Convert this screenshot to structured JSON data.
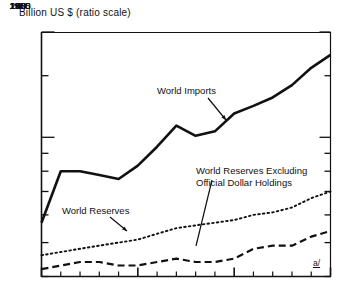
{
  "chart_data": {
    "type": "line",
    "title": "Billion US $ (ratio scale)",
    "xlabel": "",
    "ylabel": "Billion US $",
    "scale": "log",
    "grid": false,
    "legend_position": "inline-annotations",
    "axis": {
      "x_range": [
        1950,
        1965
      ],
      "y_range": [
        40,
        200
      ],
      "y_ticks": [
        200,
        150,
        100,
        90,
        80,
        70,
        60,
        50,
        40
      ],
      "y_tick_labels": [
        "200",
        "150",
        "100",
        "90",
        "80",
        "70",
        "60",
        "50",
        "40"
      ],
      "x_ticks": [
        1950,
        1955,
        1960,
        1965
      ],
      "x_tick_labels": [
        "1950",
        "1955",
        "1960",
        "1965"
      ],
      "x_minor_tick_step": 1
    },
    "x": [
      1950,
      1951,
      1952,
      1953,
      1954,
      1955,
      1956,
      1957,
      1958,
      1959,
      1960,
      1961,
      1962,
      1963,
      1964,
      1965
    ],
    "series": [
      {
        "name": "World Imports",
        "style": "solid",
        "values": [
          57,
          80,
          80,
          78,
          76,
          83,
          94,
          108,
          101,
          104,
          117,
          123,
          130,
          141,
          158,
          172
        ]
      },
      {
        "name": "World Reserves",
        "style": "dotted",
        "values": [
          46,
          47,
          48,
          49,
          50,
          51,
          53,
          55,
          56,
          57,
          58,
          60,
          61,
          63,
          67,
          70
        ]
      },
      {
        "name": "World Reserves Excluding Official Dollar Holdings",
        "style": "dashed",
        "values": [
          42,
          43,
          44,
          44,
          43,
          43,
          44,
          45,
          44,
          44,
          45,
          48,
          49,
          49,
          52,
          54
        ]
      }
    ],
    "annotations": [
      {
        "text": "World Imports",
        "target_x": 1957.8,
        "target_y": 107
      },
      {
        "text": "World Reserves",
        "target_x": 1956.3,
        "target_y": 54
      },
      {
        "text_line1": "World Reserves Excluding",
        "text_line2": "Official Dollar Holdings",
        "target_x": 1960.0,
        "target_y": 44.5
      }
    ],
    "footnote_marker": "a/",
    "colors": {
      "ink": "#111111",
      "background": "#ffffff"
    }
  },
  "labels": {
    "axis_title": "Billion US $ (ratio scale)",
    "world_imports": "World Imports",
    "world_reserves": "World Reserves",
    "world_reserves_excl_1": "World Reserves Excluding",
    "world_reserves_excl_2": "Official Dollar Holdings",
    "footnote": "a/",
    "y_200": "200",
    "y_150": "150",
    "y_100": "100",
    "y_90": "90",
    "y_80": "80",
    "y_70": "70",
    "y_60": "60",
    "y_50": "50",
    "y_40": "40",
    "x_1950": "1950",
    "x_1955": "1955",
    "x_1960": "1960",
    "x_1965": "1965"
  }
}
